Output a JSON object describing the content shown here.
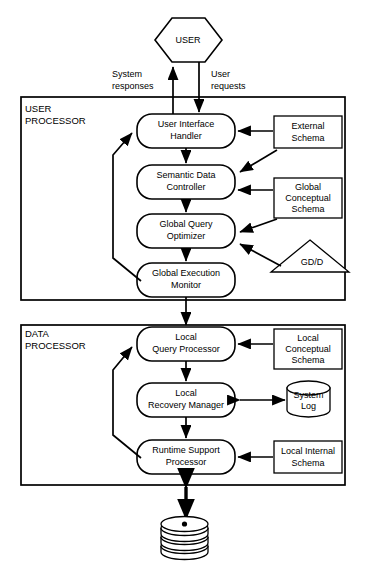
{
  "diagram": {
    "actor": {
      "label": "USER",
      "shape": "hexagon"
    },
    "frames": [
      {
        "id": "user-processor",
        "label_line1": "USER",
        "label_line2": "PROCESSOR"
      },
      {
        "id": "data-processor",
        "label_line1": "DATA",
        "label_line2": "PROCESSOR"
      }
    ],
    "flow_labels": {
      "system_responses_line1": "System",
      "system_responses_line2": "responses",
      "user_requests_line1": "User",
      "user_requests_line2": "requests"
    },
    "user_processor_nodes": [
      {
        "id": "user-interface-handler",
        "line1": "User  Interface",
        "line2": "Handler",
        "shape": "rounded-rect"
      },
      {
        "id": "semantic-data-controller",
        "line1": "Semantic Data",
        "line2": "Controller",
        "shape": "rounded-rect"
      },
      {
        "id": "global-query-optimizer",
        "line1": "Global Query",
        "line2": "Optimizer",
        "shape": "rounded-rect"
      },
      {
        "id": "global-execution-monitor",
        "line1": "Global Execution",
        "line2": "Monitor",
        "shape": "rounded-rect"
      }
    ],
    "data_processor_nodes": [
      {
        "id": "local-query-processor",
        "line1": "Local",
        "line2": "Query Processor",
        "shape": "rounded-rect"
      },
      {
        "id": "local-recovery-manager",
        "line1": "Local",
        "line2": "Recovery Manager",
        "shape": "rounded-rect"
      },
      {
        "id": "runtime-support-processor",
        "line1": "Runtime Support",
        "line2": "Processor",
        "shape": "rounded-rect"
      }
    ],
    "stores": [
      {
        "id": "external-schema",
        "line1": "External",
        "line2": "Schema",
        "line3": "",
        "shape": "rect"
      },
      {
        "id": "global-conceptual-schema",
        "line1": "Global",
        "line2": "Conceptual",
        "line3": "Schema",
        "shape": "rect"
      },
      {
        "id": "gd-d",
        "line1": "GD/D",
        "line2": "",
        "line3": "",
        "shape": "triangle"
      },
      {
        "id": "local-conceptual-schema",
        "line1": "Local",
        "line2": "Conceptual",
        "line3": "Schema",
        "shape": "rect"
      },
      {
        "id": "system-log",
        "line1": "System",
        "line2": "Log",
        "line3": "",
        "shape": "cylinder"
      },
      {
        "id": "local-internal-schema",
        "line1": "Local Internal",
        "line2": "Schema",
        "line3": "",
        "shape": "rect"
      }
    ],
    "database": {
      "id": "local-database",
      "label": "",
      "shape": "disk-stack"
    },
    "colors": {
      "stroke": "#000000",
      "fill": "#ffffff",
      "text": "#000000"
    }
  }
}
